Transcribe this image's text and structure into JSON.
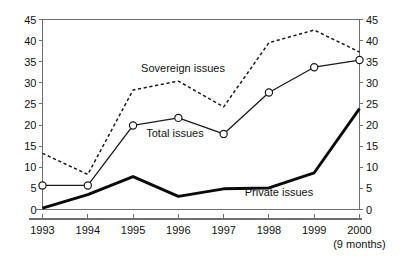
{
  "chart_data": {
    "type": "line",
    "title": "",
    "subtitle": "",
    "xlabel": "",
    "ylabel": "",
    "y_left_label": "",
    "y_right_label": "",
    "categories": [
      "1993",
      "1994",
      "1995",
      "1996",
      "1997",
      "1998",
      "1999",
      "2000"
    ],
    "x_note": "(9 months)",
    "x_note_category": "2000",
    "ylim": [
      0,
      45
    ],
    "y_ticks": [
      0,
      5,
      10,
      15,
      20,
      25,
      30,
      35,
      40,
      45
    ],
    "y_right_ticks": [
      0,
      5,
      10,
      15,
      20,
      25,
      30,
      35,
      40,
      45
    ],
    "y_right_mirrors_left": true,
    "grid": false,
    "legend": "inline-annotations",
    "series": [
      {
        "name": "Sovereign issues",
        "style": "dashed",
        "markers": false,
        "color": "#1a1a1a",
        "values": [
          13.3,
          8.3,
          28.3,
          30.4,
          24.3,
          39.5,
          42.5,
          37.3
        ]
      },
      {
        "name": "Total issues",
        "style": "solid-thin-markers",
        "markers": true,
        "color": "#1a1a1a",
        "values": [
          5.7,
          5.7,
          19.9,
          21.7,
          17.9,
          27.7,
          33.7,
          35.4
        ]
      },
      {
        "name": "Private issues",
        "style": "solid-thick",
        "markers": false,
        "color": "#0a0a0a",
        "values": [
          0.3,
          3.5,
          7.8,
          3.1,
          4.9,
          5.1,
          8.7,
          23.9
        ]
      }
    ],
    "annotations": [
      {
        "text": "Sovereign issues",
        "x_px": 183,
        "y_px": 72
      },
      {
        "text": "Total issues",
        "x_px": 175,
        "y_px": 137
      },
      {
        "text": "Private issues",
        "x_px": 279,
        "y_px": 196
      }
    ]
  },
  "axes": {
    "left_tick_labels": [
      "45",
      "40",
      "35",
      "30",
      "25",
      "20",
      "15",
      "10",
      "5",
      "0"
    ],
    "right_tick_labels": [
      "45",
      "40",
      "35",
      "30",
      "25",
      "20",
      "15",
      "10",
      "5",
      "0"
    ]
  },
  "colors": {
    "axis": "#6e6e6e",
    "text": "#111111",
    "series_line": "#1a1a1a",
    "background": "#ffffff"
  }
}
